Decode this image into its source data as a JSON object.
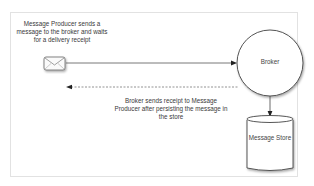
{
  "diagram": {
    "producer_note": "Message Producer sends a message to the broker and waits for a delivery receipt",
    "receipt_note": "Broker sends receipt to Message Producer after persisting the message in the store",
    "nodes": {
      "producer": {
        "icon": "envelope-icon"
      },
      "broker": {
        "label": "Broker",
        "shape": "circle"
      },
      "store": {
        "label": "Message Store",
        "shape": "cylinder"
      }
    },
    "edges": [
      {
        "from": "producer",
        "to": "broker",
        "style": "solid"
      },
      {
        "from": "broker",
        "to": "producer",
        "style": "dashed"
      },
      {
        "from": "broker",
        "to": "store",
        "style": "solid"
      }
    ],
    "colors": {
      "stroke": "#444444",
      "frame": "#e2e2e2",
      "text": "#3a3a3a"
    }
  }
}
